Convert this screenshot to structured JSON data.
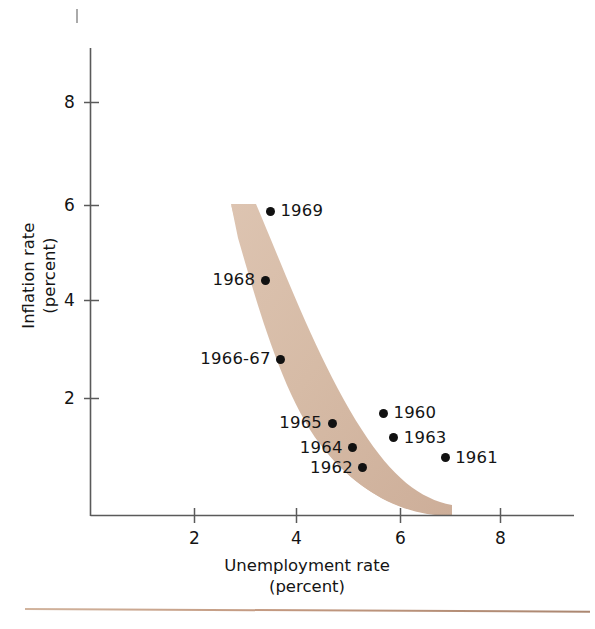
{
  "figure": {
    "background_color": "#ffffff",
    "band_color": "#d8bda8",
    "dot_color": "#111111",
    "axis_color": "#555555",
    "rule_color": "#b8876a"
  },
  "chart_data": {
    "type": "scatter",
    "title": "",
    "xlabel": "Unemployment rate",
    "xlabel_sub": "(percent)",
    "ylabel": "Inflation rate",
    "ylabel_sub": "(percent)",
    "xlim": [
      0,
      9.4
    ],
    "ylim": [
      -0.4,
      9.2
    ],
    "xticks": [
      2,
      4,
      6,
      8
    ],
    "yticks": [
      2,
      4,
      6,
      8
    ],
    "xtick_labels": [
      "2",
      "4",
      "6",
      "8"
    ],
    "ytick_labels": [
      "2",
      "4",
      "6",
      "8"
    ],
    "grid": false,
    "legend": false,
    "points": [
      {
        "label": "1969",
        "x": 3.5,
        "y": 5.8,
        "label_side": "right"
      },
      {
        "label": "1968",
        "x": 3.4,
        "y": 4.4,
        "label_side": "left"
      },
      {
        "label": "1966-67",
        "x": 3.7,
        "y": 2.8,
        "label_side": "left"
      },
      {
        "label": "1965",
        "x": 4.7,
        "y": 1.5,
        "label_side": "left"
      },
      {
        "label": "1964",
        "x": 5.1,
        "y": 1.0,
        "label_side": "left"
      },
      {
        "label": "1962",
        "x": 5.3,
        "y": 0.6,
        "label_side": "left"
      },
      {
        "label": "1960",
        "x": 5.7,
        "y": 1.7,
        "label_side": "right"
      },
      {
        "label": "1963",
        "x": 5.9,
        "y": 1.2,
        "label_side": "right"
      },
      {
        "label": "1961",
        "x": 6.9,
        "y": 0.8,
        "label_side": "right"
      }
    ],
    "annotations": [
      {
        "name": "phillips-curve-band",
        "description": "shaded hyperbolic band (Phillips curve) running from about (2.9, 6.0) down to about (7.0, 0.0)"
      }
    ]
  },
  "labels": {
    "point_1969": "1969",
    "point_1968": "1968",
    "point_1966_67": "1966-67",
    "point_1965": "1965",
    "point_1964": "1964",
    "point_1962": "1962",
    "point_1960": "1960",
    "point_1963": "1963",
    "point_1961": "1961",
    "xtick_2": "2",
    "xtick_4": "4",
    "xtick_6": "6",
    "xtick_8": "8",
    "ytick_2": "2",
    "ytick_4": "4",
    "ytick_6": "6",
    "ytick_8": "8",
    "x_axis_title": "Unemployment rate",
    "x_axis_subtitle": "(percent)",
    "y_axis_title": "Inflation rate",
    "y_axis_subtitle": "(percent)"
  }
}
